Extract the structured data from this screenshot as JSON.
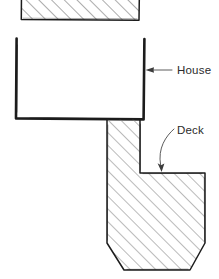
{
  "diagram": {
    "background_color": "#ffffff",
    "ink_color": "#1c1c1c",
    "hatch_color": "#6e6e6e",
    "label_color": "#2b2b2b",
    "style": "hand-drawn technical sketch",
    "labels": {
      "house": "House",
      "deck": "Deck"
    },
    "shapes": {
      "upper_hatched_block": {
        "name": "neighboring-structure",
        "fill": "diagonal-hatch",
        "outline": "solid",
        "bounds": {
          "x": 21,
          "y": -6,
          "width": 118,
          "height": 26
        }
      },
      "house_outline": {
        "name": "house-footprint",
        "fill": "none",
        "outline": "heavy-solid",
        "bounds": {
          "x": 16,
          "y": 38,
          "width": 128,
          "height": 81
        },
        "open_side": "top"
      },
      "deck_polygon": {
        "name": "deck-footprint",
        "fill": "diagonal-hatch",
        "outline": "solid",
        "description": "L-shaped deck with chamfered bottom corners",
        "points": "107,119 140,119 140,173 205,173 205,243 190,270 124,270 107,243"
      }
    },
    "annotations": [
      {
        "name": "house-callout",
        "text": "House",
        "leader": "straight-horizontal",
        "arrow_direction": "left",
        "text_x": 177,
        "text_y": 74,
        "arrow_tip_x": 146,
        "arrow_tip_y": 70
      },
      {
        "name": "deck-callout",
        "text": "Deck",
        "leader": "curved",
        "arrow_direction": "down",
        "text_x": 177,
        "text_y": 134,
        "arrow_tip_x": 162,
        "arrow_tip_y": 172
      }
    ]
  }
}
